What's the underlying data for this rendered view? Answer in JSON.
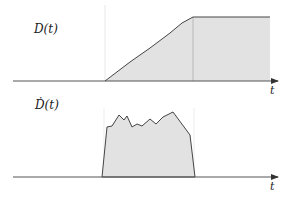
{
  "top_plot": {
    "label": "D(t)",
    "axis_label": "t",
    "fill_color": "#e2e2e2",
    "line_color": "#444444",
    "guide_color": "#bdbdbd",
    "description": "Cumulative D(t): zero, then ramps up linearly, then saturates at a plateau"
  },
  "bottom_plot": {
    "label": "Ḋ(t)",
    "axis_label": "t",
    "fill_color": "#e2e2e2",
    "line_color": "#444444",
    "description": "Derivative Ḋ(t): zero, then a noisy rectangular pulse, then zero"
  },
  "colors": {
    "axis": "#555555",
    "background": "#ffffff"
  }
}
